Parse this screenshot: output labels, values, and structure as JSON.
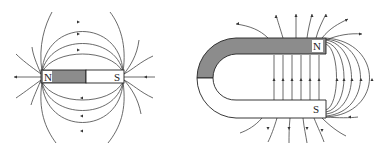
{
  "figure": {
    "bar_magnet": {
      "north_label": "N",
      "south_label": "S",
      "north_fill": "#8c8c8c",
      "south_fill": "#ffffff"
    },
    "horseshoe_magnet": {
      "north_label": "N",
      "south_label": "S",
      "north_fill": "#8c8c8c",
      "south_fill": "#ffffff"
    },
    "line_color": "#333333"
  }
}
